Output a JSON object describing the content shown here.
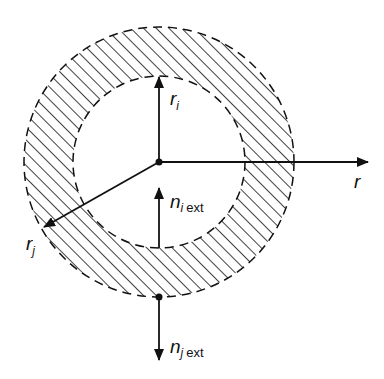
{
  "diagram": {
    "type": "annulus-cross-section",
    "colors": {
      "ink": "#111111",
      "background": "#ffffff"
    },
    "geometry": {
      "center": [
        159,
        162
      ],
      "inner_radius": 86,
      "outer_radius": 135,
      "hatch_angle_deg": 45,
      "hatch_spacing": 9
    },
    "labels": {
      "r_i": {
        "main": "r",
        "sub": "i",
        "ext": ""
      },
      "r_j": {
        "main": "r",
        "sub": "j",
        "ext": ""
      },
      "r_axis": {
        "main": "r"
      },
      "n_i_ext": {
        "main": "n",
        "sub": "i",
        "ext": "ext"
      },
      "n_j_ext": {
        "main": "n",
        "sub": "j",
        "ext": "ext"
      }
    },
    "arrows": [
      {
        "name": "r_i",
        "from": [
          159,
          162
        ],
        "to": [
          159,
          76
        ]
      },
      {
        "name": "r_j",
        "from": [
          159,
          162
        ],
        "to": [
          44,
          227
        ]
      },
      {
        "name": "r_axis",
        "from": [
          159,
          162
        ],
        "to": [
          368,
          162
        ]
      },
      {
        "name": "n_i_ext",
        "from": [
          159,
          248
        ],
        "to": [
          159,
          188
        ]
      },
      {
        "name": "n_j_ext",
        "from": [
          159,
          297
        ],
        "to": [
          159,
          360
        ]
      }
    ]
  }
}
